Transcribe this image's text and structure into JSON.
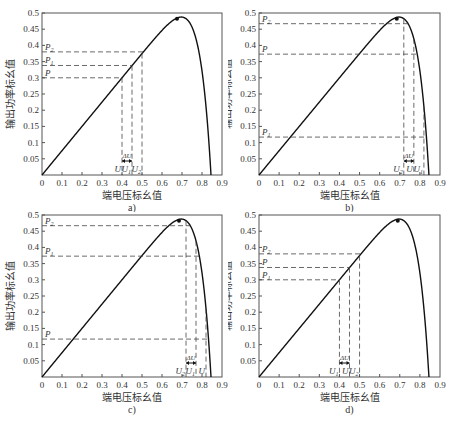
{
  "chart_data": [
    {
      "type": "line",
      "caption": "a)",
      "xlabel": "端电压标幺值",
      "ylabel": "输出功率标幺值",
      "xlim": [
        0,
        0.9
      ],
      "ylim": [
        0,
        0.5
      ],
      "xticks": [
        "0",
        "0.1",
        "0.2",
        "0.3",
        "0.4",
        "0.5",
        "0.6",
        "0.7",
        "0.8",
        "0.9"
      ],
      "yticks": [
        "0.05",
        "0.1",
        "0.15",
        "0.2",
        "0.25",
        "0.3",
        "0.35",
        "0.4",
        "0.45",
        "0.5"
      ],
      "series": [
        {
          "name": "P-U curve",
          "x": [
            0,
            0.1,
            0.2,
            0.3,
            0.4,
            0.5,
            0.6,
            0.65,
            0.68,
            0.72,
            0.76,
            0.8,
            0.83,
            0.845
          ],
          "y": [
            0,
            0.075,
            0.15,
            0.225,
            0.3,
            0.375,
            0.445,
            0.47,
            0.482,
            0.47,
            0.42,
            0.3,
            0.12,
            0
          ]
        }
      ],
      "mpp": {
        "x": 0.675,
        "y": 0.482
      },
      "annotations": {
        "levels": [
          {
            "label": "P",
            "sub": "",
            "y": 0.3
          },
          {
            "label": "P",
            "sub": "1",
            "y": 0.338
          },
          {
            "label": "P",
            "sub": "2",
            "y": 0.38
          }
        ],
        "voltages": [
          {
            "label": "U",
            "sub": "",
            "x": 0.4
          },
          {
            "label": "U",
            "sub": "1",
            "x": 0.45
          },
          {
            "label": "U",
            "sub": "2",
            "x": 0.5
          }
        ],
        "delta": {
          "label": "ΔU",
          "x0": 0.4,
          "x1": 0.45
        }
      }
    },
    {
      "type": "line",
      "caption": "b)",
      "xlabel": "端电压标幺值",
      "ylabel": "输出功率标幺值",
      "xlim": [
        0,
        0.9
      ],
      "ylim": [
        0,
        0.5
      ],
      "xticks": [
        "0",
        "0.1",
        "0.2",
        "0.3",
        "0.4",
        "0.5",
        "0.6",
        "0.7",
        "0.8",
        "0.9"
      ],
      "yticks": [
        "0.05",
        "0.1",
        "0.15",
        "0.2",
        "0.25",
        "0.3",
        "0.35",
        "0.4",
        "0.45",
        "0.5"
      ],
      "series": [
        {
          "name": "P-U curve",
          "x": [
            0,
            0.1,
            0.2,
            0.3,
            0.4,
            0.5,
            0.6,
            0.65,
            0.68,
            0.72,
            0.76,
            0.8,
            0.83,
            0.845
          ],
          "y": [
            0,
            0.075,
            0.15,
            0.225,
            0.3,
            0.375,
            0.445,
            0.47,
            0.482,
            0.47,
            0.42,
            0.3,
            0.12,
            0
          ]
        }
      ],
      "mpp": {
        "x": 0.685,
        "y": 0.482
      },
      "annotations": {
        "levels": [
          {
            "label": "P",
            "sub": "2",
            "y": 0.467
          },
          {
            "label": "P",
            "sub": "",
            "y": 0.373
          },
          {
            "label": "P",
            "sub": "1",
            "y": 0.117
          }
        ],
        "voltages": [
          {
            "label": "U",
            "sub": "2",
            "x": 0.72
          },
          {
            "label": "U",
            "sub": "",
            "x": 0.77
          },
          {
            "label": "U",
            "sub": "1",
            "x": 0.82
          }
        ],
        "delta": {
          "label": "ΔU",
          "x0": 0.72,
          "x1": 0.77
        }
      }
    },
    {
      "type": "line",
      "caption": "c)",
      "xlabel": "端电压标幺值",
      "ylabel": "输出功率标幺值",
      "xlim": [
        0,
        0.9
      ],
      "ylim": [
        0,
        0.5
      ],
      "xticks": [
        "0",
        "0.1",
        "0.2",
        "0.3",
        "0.4",
        "0.5",
        "0.6",
        "0.7",
        "0.8",
        "0.9"
      ],
      "yticks": [
        "0.05",
        "0.1",
        "0.15",
        "0.2",
        "0.25",
        "0.3",
        "0.35",
        "0.4",
        "0.45",
        "0.5"
      ],
      "series": [
        {
          "name": "P-U curve",
          "x": [
            0,
            0.1,
            0.2,
            0.3,
            0.4,
            0.5,
            0.6,
            0.65,
            0.68,
            0.72,
            0.76,
            0.8,
            0.83,
            0.845
          ],
          "y": [
            0,
            0.075,
            0.15,
            0.225,
            0.3,
            0.375,
            0.445,
            0.47,
            0.482,
            0.47,
            0.42,
            0.3,
            0.12,
            0
          ]
        }
      ],
      "mpp": {
        "x": 0.685,
        "y": 0.482
      },
      "annotations": {
        "levels": [
          {
            "label": "P",
            "sub": "2",
            "y": 0.467
          },
          {
            "label": "P",
            "sub": "1",
            "y": 0.373
          },
          {
            "label": "P",
            "sub": "",
            "y": 0.117
          }
        ],
        "voltages": [
          {
            "label": "U",
            "sub": "2",
            "x": 0.72
          },
          {
            "label": "U",
            "sub": "1",
            "x": 0.77
          },
          {
            "label": "U",
            "sub": "",
            "x": 0.82
          }
        ],
        "delta": {
          "label": "ΔU",
          "x0": 0.72,
          "x1": 0.77
        }
      }
    },
    {
      "type": "line",
      "caption": "d)",
      "xlabel": "端电压标幺值",
      "ylabel": "输出功率标幺值",
      "xlim": [
        0,
        0.9
      ],
      "ylim": [
        0,
        0.5
      ],
      "xticks": [
        "0",
        "0.1",
        "0.2",
        "0.3",
        "0.4",
        "0.5",
        "0.6",
        "0.7",
        "0.8",
        "0.9"
      ],
      "yticks": [
        "0.05",
        "0.1",
        "0.15",
        "0.2",
        "0.25",
        "0.3",
        "0.35",
        "0.4",
        "0.45",
        "0.5"
      ],
      "series": [
        {
          "name": "P-U curve",
          "x": [
            0,
            0.1,
            0.2,
            0.3,
            0.4,
            0.5,
            0.6,
            0.65,
            0.68,
            0.72,
            0.76,
            0.8,
            0.83,
            0.845
          ],
          "y": [
            0,
            0.075,
            0.15,
            0.225,
            0.3,
            0.375,
            0.445,
            0.47,
            0.482,
            0.47,
            0.42,
            0.3,
            0.12,
            0
          ]
        }
      ],
      "mpp": {
        "x": 0.69,
        "y": 0.482
      },
      "annotations": {
        "levels": [
          {
            "label": "P",
            "sub": "2",
            "y": 0.38
          },
          {
            "label": "P",
            "sub": "",
            "y": 0.338
          },
          {
            "label": "P",
            "sub": "1",
            "y": 0.3
          }
        ],
        "voltages": [
          {
            "label": "U",
            "sub": "1",
            "x": 0.4
          },
          {
            "label": "U",
            "sub": "",
            "x": 0.45
          },
          {
            "label": "U",
            "sub": "2",
            "x": 0.5
          }
        ],
        "delta": {
          "label": "ΔU",
          "x0": 0.4,
          "x1": 0.45
        }
      }
    }
  ]
}
